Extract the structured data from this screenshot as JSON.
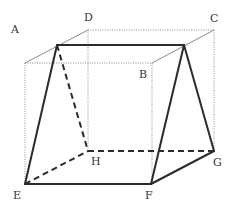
{
  "diagram": {
    "type": "cube-with-inscribed-prism",
    "labels": {
      "A": "A",
      "B": "B",
      "C": "C",
      "D": "D",
      "E": "E",
      "F": "F",
      "G": "G",
      "H": "H"
    },
    "vertices": {
      "A": [
        25,
        63
      ],
      "B": [
        152,
        63
      ],
      "C": [
        214,
        30
      ],
      "D": [
        88,
        30
      ],
      "E": [
        25,
        184
      ],
      "F": [
        151,
        184
      ],
      "G": [
        214,
        151
      ],
      "H": [
        88,
        151
      ],
      "P": [
        57,
        45
      ],
      "Q": [
        184,
        45
      ]
    },
    "label_positions": {
      "A": [
        11,
        33
      ],
      "B": [
        139,
        78
      ],
      "C": [
        210,
        22
      ],
      "D": [
        84,
        21
      ],
      "E": [
        13,
        199
      ],
      "F": [
        145,
        199
      ],
      "G": [
        213,
        166
      ],
      "H": [
        91,
        165
      ]
    },
    "colors": {
      "solid_edge": "#2b2b2b",
      "dotted_edge": "#8a8a8a",
      "label": "#333333",
      "background": "#ffffff"
    }
  }
}
